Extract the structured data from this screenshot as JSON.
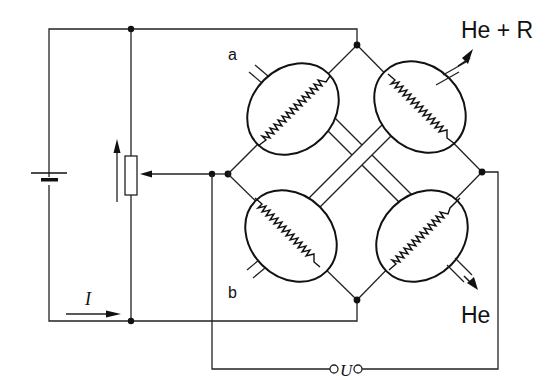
{
  "diagram": {
    "colors": {
      "line": "#222222",
      "background": "#ffffff"
    },
    "labels": {
      "cell_a": "a",
      "cell_b": "b",
      "outlet_top": "He + R",
      "outlet_bottom": "He",
      "current": "I",
      "voltage": "U"
    },
    "components": [
      {
        "name": "battery",
        "type": "dc-source"
      },
      {
        "name": "potentiometer",
        "type": "variable-resistor"
      },
      {
        "name": "cell-top-left",
        "label": "a",
        "type": "filament-cell"
      },
      {
        "name": "cell-top-right",
        "type": "filament-cell",
        "outlet": "He + R"
      },
      {
        "name": "cell-bottom-left",
        "label": "b",
        "type": "filament-cell"
      },
      {
        "name": "cell-bottom-right",
        "type": "filament-cell",
        "outlet": "He"
      },
      {
        "name": "output-terminals",
        "label": "U"
      }
    ]
  }
}
